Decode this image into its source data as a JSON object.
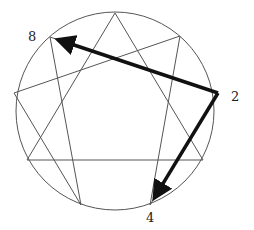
{
  "diagram": {
    "circle": {
      "cx": 115,
      "cy": 111,
      "r": 99
    },
    "points": {
      "9": [
        115,
        13
      ],
      "1": [
        180,
        36
      ],
      "2": [
        218,
        93
      ],
      "3": [
        203,
        160
      ],
      "4": [
        150,
        205
      ],
      "5": [
        81,
        205
      ],
      "6": [
        27,
        160
      ],
      "7": [
        14,
        93
      ],
      "8": [
        50,
        37
      ]
    },
    "lines": [
      [
        "9",
        "3"
      ],
      [
        "3",
        "6"
      ],
      [
        "6",
        "9"
      ],
      [
        "1",
        "4"
      ],
      [
        "4",
        "2"
      ],
      [
        "2",
        "8"
      ],
      [
        "8",
        "5"
      ],
      [
        "5",
        "7"
      ],
      [
        "7",
        "1"
      ]
    ],
    "arrows": [
      {
        "from": "2",
        "to": "8"
      },
      {
        "from": "2",
        "to": "4"
      }
    ],
    "labels": [
      {
        "text": "8",
        "x": 28,
        "y": 30
      },
      {
        "text": "2",
        "x": 231,
        "y": 90
      },
      {
        "text": "4",
        "x": 146,
        "y": 211
      }
    ],
    "colors": {
      "line": "#555555",
      "arrow": "#111111"
    }
  }
}
